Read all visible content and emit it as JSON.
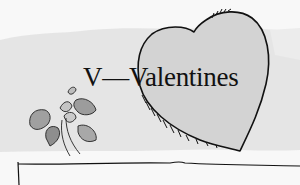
{
  "illustration": {
    "title": "V—Valentines",
    "elements": [
      "watercolor-wash-band",
      "heart-outline",
      "violet-plant",
      "ground-line"
    ],
    "colors": {
      "background": "#f8f8f8",
      "wash": "#dcdcdc",
      "heart_fill": "#d4d4d4",
      "ink": "#111111",
      "leaf": "#9a9a9a"
    }
  }
}
